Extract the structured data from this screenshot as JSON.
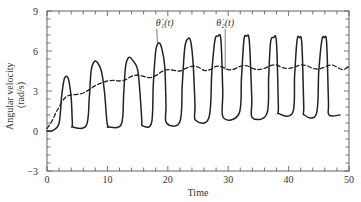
{
  "chart_data": {
    "type": "line",
    "title": "",
    "xlabel": "Time",
    "ylabel": "Angular velocity (rad/s)",
    "ylabel_lines": [
      "Angular velocity",
      "(rad/s)"
    ],
    "xlim": [
      0,
      50
    ],
    "ylim": [
      -3,
      9
    ],
    "xticks": [
      0,
      10,
      20,
      30,
      40,
      50
    ],
    "yticks": [
      -3,
      0,
      3,
      6,
      9
    ],
    "xtick_labels": [
      "0",
      "10",
      "20",
      "30",
      "40",
      "50"
    ],
    "ytick_labels": [
      "−3",
      "0",
      "3",
      "6",
      "9"
    ],
    "minor_xtick_step": 2,
    "minor_ytick_step": 0.6,
    "grid": false,
    "legend": null,
    "annotations": [
      {
        "text": "θ̇₁(t)",
        "series": "theta1_dot",
        "x": 19.5,
        "y": 7.9,
        "pointer_to": [
          18.3,
          6.5
        ]
      },
      {
        "text": "θ̇₂(t)",
        "series": "theta2_dot",
        "x": 29.5,
        "y": 7.9,
        "pointer_to": [
          29.5,
          4.6
        ]
      }
    ],
    "series": [
      {
        "name": "θ̇₁(t)",
        "id": "theta1_dot",
        "style": "solid",
        "color": "#222222",
        "x": [
          0,
          1,
          2,
          2.4,
          2.8,
          3.2,
          3.6,
          4.0,
          4.2,
          4.3,
          6.5,
          7.0,
          7.3,
          7.8,
          8.4,
          9.0,
          9.5,
          9.9,
          10.1,
          10.2,
          12.3,
          12.7,
          13.0,
          13.5,
          14.2,
          15.0,
          15.4,
          15.7,
          15.8,
          17.3,
          17.6,
          18.0,
          18.5,
          19.0,
          19.5,
          19.7,
          19.8,
          22.0,
          22.4,
          22.8,
          23.3,
          23.8,
          24.2,
          24.5,
          24.6,
          26.8,
          27.3,
          27.8,
          28.3,
          28.8,
          29.1,
          29.2,
          31.8,
          32.2,
          32.6,
          33.0,
          33.5,
          33.9,
          34.0,
          36.4,
          36.7,
          37.0,
          37.5,
          38.0,
          38.3,
          38.4,
          40.7,
          41.0,
          41.4,
          41.8,
          42.2,
          42.5,
          42.6,
          44.6,
          45.0,
          45.5,
          45.9,
          46.3,
          46.6,
          46.7,
          48.5
        ],
        "y": [
          0,
          0.05,
          0.6,
          2.5,
          3.8,
          4.1,
          3.8,
          2.5,
          0.6,
          0.3,
          0.4,
          2.5,
          4.5,
          5.2,
          5.1,
          4.5,
          3.0,
          0.8,
          0.35,
          0.3,
          0.5,
          2.8,
          4.8,
          5.5,
          5.3,
          4.6,
          2.8,
          0.8,
          0.4,
          0.6,
          3.5,
          6.0,
          6.6,
          6.2,
          4.8,
          2.0,
          0.6,
          0.7,
          3.5,
          6.2,
          6.9,
          6.7,
          5.0,
          2.0,
          0.8,
          1.0,
          4.5,
          6.8,
          7.1,
          6.8,
          3.0,
          1.0,
          1.3,
          4.0,
          6.8,
          7.1,
          6.7,
          2.5,
          1.0,
          1.3,
          4.0,
          6.6,
          7.0,
          6.6,
          2.0,
          1.3,
          1.4,
          4.2,
          6.8,
          7.0,
          6.5,
          2.0,
          1.2,
          1.3,
          4.5,
          6.8,
          7.0,
          6.6,
          2.2,
          1.2,
          1.2
        ]
      },
      {
        "name": "θ̇₂(t)",
        "id": "theta2_dot",
        "style": "dashed",
        "color": "#222222",
        "x": [
          0,
          0.5,
          1,
          1.5,
          2,
          2.5,
          3,
          3.5,
          4,
          5,
          6,
          7,
          8,
          9,
          10,
          11,
          12,
          13,
          14,
          15,
          16,
          17,
          18,
          19,
          20,
          21,
          22,
          23,
          24,
          25,
          26,
          27,
          28,
          29,
          30,
          31,
          32,
          33,
          34,
          35,
          36,
          37,
          38,
          39,
          40,
          41,
          42,
          43,
          44,
          45,
          46,
          47,
          48,
          49,
          50
        ],
        "y": [
          0.2,
          0.5,
          0.9,
          1.4,
          1.8,
          2.2,
          2.5,
          2.65,
          2.7,
          2.75,
          2.85,
          3.1,
          3.4,
          3.6,
          3.75,
          3.8,
          3.75,
          3.85,
          4.1,
          4.2,
          4.1,
          4.0,
          4.15,
          4.45,
          4.6,
          4.55,
          4.5,
          4.7,
          4.85,
          4.8,
          4.55,
          4.6,
          4.85,
          4.8,
          4.6,
          4.65,
          4.85,
          4.9,
          4.7,
          4.6,
          4.7,
          4.9,
          4.95,
          4.75,
          4.7,
          4.8,
          4.95,
          4.9,
          4.7,
          4.65,
          4.8,
          4.95,
          4.8,
          4.6,
          4.85
        ]
      }
    ]
  },
  "layout": {
    "plot_left": 47,
    "plot_right": 349,
    "plot_top": 11,
    "plot_bottom": 171
  }
}
